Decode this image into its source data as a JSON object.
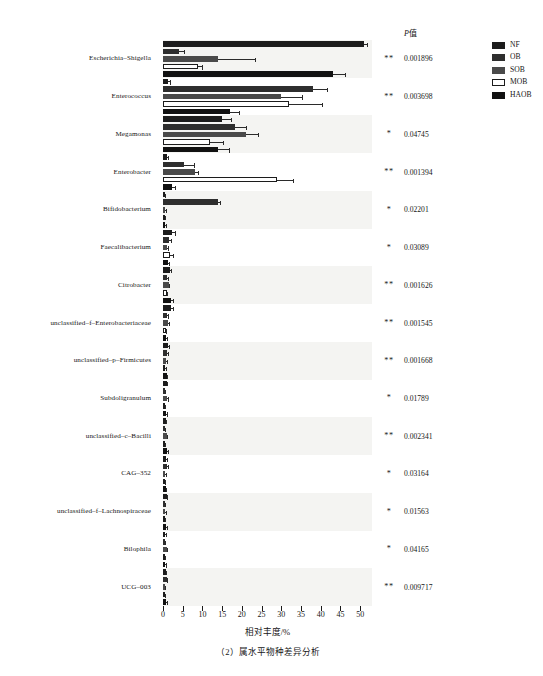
{
  "chart_data": {
    "type": "bar",
    "orientation": "horizontal",
    "grouped": true,
    "title": "",
    "caption": "（2）属水平物种差异分析",
    "xlabel": "相对丰度/%",
    "ylabel": "",
    "xlim": [
      0,
      53
    ],
    "xticks": [
      0,
      5,
      10,
      15,
      20,
      25,
      30,
      35,
      40,
      45,
      50
    ],
    "grid": false,
    "legend_position": "right",
    "pvalue_header": "P值",
    "categories": [
      "Escherichia–Shigella",
      "Enterococcus",
      "Megamonas",
      "Enterobacter",
      "Bifidobacterium",
      "Faecalibacterium",
      "Citrobacter",
      "unclassified–f–Enterobacteriaceae",
      "unclassified–p–Firmicutes",
      "Subdoligranulum",
      "unclassified–c–Bacilli",
      "CAG–352",
      "unclassified–f–Lachnospiraceae",
      "Bilophila",
      "UCG–003"
    ],
    "series": [
      {
        "name": "NF",
        "color": "#1c1c1c",
        "values": [
          51.0,
          1.2,
          15.0,
          1.0,
          0.4,
          2.2,
          1.8,
          2.0,
          1.3,
          0.9,
          0.7,
          0.8,
          0.9,
          0.6,
          0.7
        ],
        "errors": [
          1.0,
          0.9,
          2.6,
          0.5,
          0.3,
          1.0,
          0.6,
          0.7,
          0.5,
          0.4,
          0.3,
          0.4,
          0.4,
          0.3,
          0.3
        ]
      },
      {
        "name": "OB",
        "color": "#2e2e2e",
        "values": [
          4.0,
          38.0,
          18.2,
          5.2,
          14.0,
          1.5,
          1.0,
          0.9,
          1.0,
          0.5,
          0.5,
          0.9,
          0.5,
          0.5,
          0.9
        ],
        "errors": [
          1.6,
          3.8,
          3.0,
          2.8,
          0.8,
          0.8,
          0.4,
          0.5,
          0.4,
          0.3,
          0.3,
          0.5,
          0.3,
          0.3,
          0.4
        ]
      },
      {
        "name": "SOB",
        "color": "#4a4a4a",
        "values": [
          14.0,
          30.0,
          21.0,
          8.0,
          0.6,
          1.0,
          1.4,
          1.2,
          0.8,
          1.0,
          0.9,
          0.6,
          0.6,
          0.9,
          0.5
        ],
        "errors": [
          9.5,
          5.5,
          3.3,
          1.2,
          0.4,
          0.5,
          0.5,
          0.6,
          0.4,
          0.5,
          0.4,
          0.3,
          0.3,
          0.4,
          0.3
        ]
      },
      {
        "name": "MOB",
        "color": "#ffffff",
        "values": [
          9.0,
          32.0,
          12.0,
          29.0,
          0.4,
          1.9,
          0.9,
          0.7,
          0.6,
          0.5,
          0.4,
          0.5,
          0.5,
          0.4,
          0.5
        ],
        "errors": [
          1.2,
          8.5,
          3.5,
          4.2,
          0.3,
          0.9,
          0.4,
          0.4,
          0.3,
          0.3,
          0.3,
          0.3,
          0.3,
          0.3,
          0.3
        ]
      },
      {
        "name": "HAOB",
        "color": "#111111",
        "values": [
          43.0,
          17.0,
          14.0,
          2.2,
          0.6,
          1.2,
          2.0,
          0.8,
          0.9,
          0.8,
          1.0,
          0.7,
          0.8,
          0.6,
          0.8
        ],
        "errors": [
          3.5,
          2.5,
          3.0,
          1.0,
          0.3,
          0.5,
          0.7,
          0.4,
          0.4,
          0.4,
          0.4,
          0.3,
          0.4,
          0.3,
          0.4
        ]
      }
    ],
    "significance": [
      "**",
      "**",
      "*",
      "**",
      "*",
      "*",
      "**",
      "**",
      "**",
      "*",
      "**",
      "*",
      "*",
      "*",
      "**"
    ],
    "pvalues": [
      "0.001896",
      "0.003698",
      "0.04745",
      "0.001394",
      "0.02201",
      "0.03089",
      "0.001626",
      "0.001545",
      "0.001668",
      "0.01789",
      "0.002341",
      "0.03164",
      "0.01563",
      "0.04165",
      "0.009717"
    ]
  }
}
